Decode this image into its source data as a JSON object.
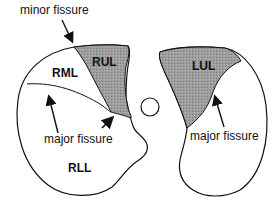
{
  "diagram": {
    "colors": {
      "upper_lobe_fill": "#9a9a9a",
      "outline": "#111111",
      "background": "#ffffff"
    },
    "right_lung": {
      "lobes": {
        "rul": "RUL",
        "rml": "RML",
        "rll": "RLL"
      },
      "labels": {
        "minor_fissure": "minor fissure",
        "major_fissure": "major fissure"
      }
    },
    "left_lung": {
      "lobes": {
        "lul": "LUL"
      },
      "labels": {
        "major_fissure": "major fissure"
      }
    }
  }
}
